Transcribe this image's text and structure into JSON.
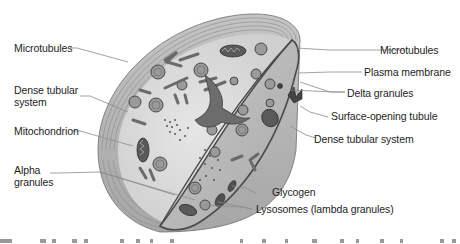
{
  "figure": {
    "colors": {
      "background": "#ffffff",
      "outer_band": "#b9b9b9",
      "outer_band_lines": "#8a8a8a",
      "cytoplasm": "#dcdcdc",
      "cut_face": "#bdbdbd",
      "organelle_dark": "#555555",
      "membrane": "#4a4a4a",
      "leader_line": "#8c8c8c",
      "label_text": "#1e1e1e"
    },
    "labels_left": [
      {
        "id": "microtubules-left",
        "text": "Microtubules",
        "line2": ""
      },
      {
        "id": "dense-tubular-left",
        "text": "Dense tubular",
        "line2": "system"
      },
      {
        "id": "mitochondrion",
        "text": "Mitochondrion",
        "line2": ""
      },
      {
        "id": "alpha-granules",
        "text": "Alpha",
        "line2": "granules"
      }
    ],
    "labels_right": [
      {
        "id": "microtubules-right",
        "text": "Microtubules"
      },
      {
        "id": "plasma-membrane",
        "text": "Plasma membrane"
      },
      {
        "id": "delta-granules",
        "text": "Delta granules"
      },
      {
        "id": "surface-opening-tubule",
        "text": "Surface-opening tubule"
      },
      {
        "id": "dense-tubular-right",
        "text": "Dense tubular system"
      },
      {
        "id": "glycogen",
        "text": "Glycogen"
      },
      {
        "id": "lysosomes",
        "text": "Lysosomes (lambda granules)"
      }
    ]
  }
}
